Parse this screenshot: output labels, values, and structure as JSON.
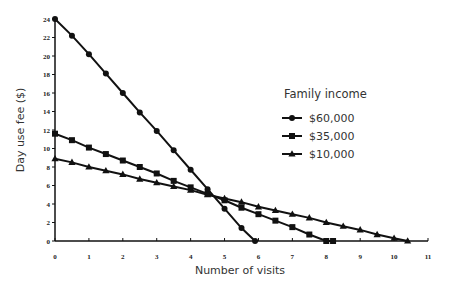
{
  "chart_data": {
    "type": "line",
    "title": "",
    "xlabel": "Number of visits",
    "ylabel": "Day use fee ($)",
    "xlim": [
      0,
      11
    ],
    "ylim": [
      0,
      24
    ],
    "xticks": [
      0,
      1,
      2,
      3,
      4,
      5,
      6,
      7,
      8,
      9,
      10,
      11
    ],
    "yticks": [
      0,
      2,
      4,
      6,
      8,
      10,
      12,
      14,
      16,
      18,
      20,
      22,
      24
    ],
    "grid": false,
    "legend": {
      "title": "Family income",
      "position": "right-upper"
    },
    "series": [
      {
        "name": "$60,000",
        "marker": "circle",
        "x": [
          0,
          0.5,
          1,
          1.5,
          2,
          2.5,
          3,
          3.5,
          4,
          4.5,
          5,
          5.5,
          5.9
        ],
        "y": [
          24,
          22.2,
          20.2,
          18.1,
          16,
          13.9,
          11.9,
          9.8,
          7.7,
          5.6,
          3.5,
          1.4,
          0
        ]
      },
      {
        "name": "$35,000",
        "marker": "square",
        "x": [
          0,
          0.5,
          1,
          1.5,
          2,
          2.5,
          3,
          3.5,
          4,
          4.5,
          5,
          5.5,
          6,
          6.5,
          7,
          7.5,
          8,
          8.2
        ],
        "y": [
          11.6,
          10.9,
          10.1,
          9.4,
          8.7,
          8.0,
          7.3,
          6.5,
          5.8,
          5.1,
          4.4,
          3.6,
          2.9,
          2.2,
          1.5,
          0.7,
          0,
          0
        ]
      },
      {
        "name": "$10,000",
        "marker": "triangle",
        "x": [
          0,
          0.5,
          1,
          1.5,
          2,
          2.5,
          3,
          3.5,
          4,
          4.5,
          5,
          5.5,
          6,
          6.5,
          7,
          7.5,
          8,
          8.5,
          9,
          9.5,
          10,
          10.4
        ],
        "y": [
          8.9,
          8.5,
          8.0,
          7.6,
          7.2,
          6.7,
          6.3,
          5.9,
          5.5,
          5.0,
          4.6,
          4.2,
          3.7,
          3.3,
          2.9,
          2.5,
          2.0,
          1.6,
          1.2,
          0.7,
          0.3,
          0
        ]
      }
    ]
  }
}
